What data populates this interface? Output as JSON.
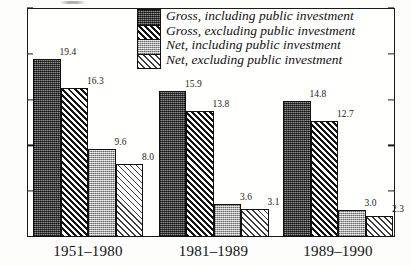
{
  "chart_data": {
    "type": "bar",
    "title": "",
    "subtitle": "",
    "xlabel": "",
    "ylabel": "",
    "categories": [
      "1951–1980",
      "1981–1989",
      "1989–1990"
    ],
    "series": [
      {
        "name": "Gross, including public investment",
        "key": "gross-incl",
        "values": [
          19.4,
          15.9,
          14.8
        ],
        "labels": [
          "19.4",
          "15.9",
          "14.8"
        ],
        "pattern": "dark-stipple"
      },
      {
        "name": "Gross, excluding public investment",
        "key": "gross-excl",
        "values": [
          16.3,
          13.8,
          12.7
        ],
        "labels": [
          "16.3",
          "13.8",
          "12.7"
        ],
        "pattern": "dark-diagonal-hatch"
      },
      {
        "name": "Net, including public investment",
        "key": "net-incl",
        "values": [
          9.6,
          3.6,
          3.0
        ],
        "labels": [
          "9.6",
          "3.6",
          "3.0"
        ],
        "pattern": "light-stipple"
      },
      {
        "name": "Net, excluding public investment",
        "key": "net-excl",
        "values": [
          8.0,
          3.1,
          2.3
        ],
        "labels": [
          "8.0",
          "3.1",
          "2.3"
        ],
        "pattern": "light-diagonal-hatch"
      }
    ],
    "ylim": [
      0,
      25
    ],
    "yticks": [
      0,
      5,
      10,
      15,
      20,
      25
    ],
    "ytick_labels": [
      "0",
      "5",
      "10",
      "15",
      "20",
      "25"
    ],
    "grid": false,
    "legend_position": "top-center",
    "legend_entries": [
      "Gross, including public investment",
      "Gross, excluding public investment",
      "Net, including public investment",
      "Net, excluding public investment"
    ],
    "colors": {
      "axis": "#1a1a1a",
      "text": "#121212",
      "background": "#fffffd",
      "dark_fill": "#5d5d5d",
      "light_fill": "#c3c3c3",
      "hatch": "#141414"
    }
  }
}
